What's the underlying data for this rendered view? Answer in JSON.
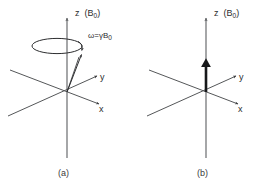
{
  "figure": {
    "background_color": "#ffffff",
    "line_color": "#2d2e30",
    "axis_color": "#555759",
    "panels": [
      {
        "id": "panel-a",
        "caption": "(a)",
        "origin": [
          67,
          92
        ],
        "axes": [
          {
            "name": "z",
            "label": "z",
            "paren_label": "(B",
            "paren_sub": "0",
            "paren_close": ")"
          },
          {
            "name": "y",
            "label": "y"
          },
          {
            "name": "x",
            "label": "x"
          }
        ],
        "annotation": {
          "name": "precession-frequency",
          "omega": "ω",
          "equals": "=",
          "gamma": "γ",
          "field": "B",
          "field_sub": "0",
          "text": "ω=γB₀"
        },
        "vector": {
          "name": "magnetization-vector",
          "tip": [
            82,
            53
          ],
          "description": "precessing magnetization vector tilted from z"
        },
        "precession_circle": {
          "name": "precession-ellipse",
          "center": [
            57,
            46
          ],
          "rx": 25,
          "ry": 7.5,
          "direction": "clockwise-viewed-from-above"
        }
      },
      {
        "id": "panel-b",
        "caption": "(b)",
        "origin": [
          206,
          92
        ],
        "axes": [
          {
            "name": "z",
            "label": "z",
            "paren_label": "(B",
            "paren_sub": "0",
            "paren_close": ")"
          },
          {
            "name": "y",
            "label": "y"
          },
          {
            "name": "x",
            "label": "x"
          }
        ],
        "vector": {
          "name": "net-magnetization-vector",
          "tip": [
            206,
            58
          ],
          "description": "net magnetization aligned along +z"
        }
      }
    ]
  }
}
